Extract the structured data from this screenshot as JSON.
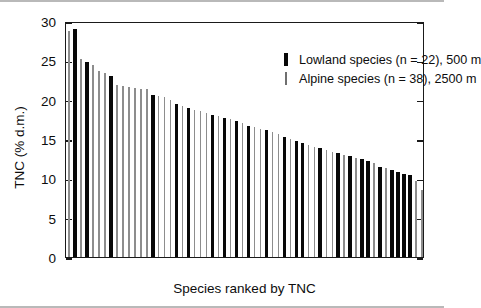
{
  "chart_data": {
    "type": "bar",
    "title": "",
    "subtitle": "",
    "xlabel": "Species ranked by TNC",
    "ylabel": "TNC (% d.m.)",
    "ylim": [
      0,
      30
    ],
    "yticks": [
      0,
      5,
      10,
      15,
      20,
      25,
      30
    ],
    "ytick_labels": [
      "0",
      "5",
      "10",
      "15",
      "20",
      "25",
      "30"
    ],
    "grid": false,
    "legend_position": "top-right",
    "legend": [
      {
        "key": "thick-black-bar",
        "label": "Lowland species (n = 22), 500 m"
      },
      {
        "key": "thin-gray-bar",
        "label": "Alpine species (n = 38), 2500 m"
      }
    ],
    "series": [
      {
        "name": "Lowland species (n = 22), 500 m",
        "count": 22,
        "color": "#080808",
        "bar_style": "thick"
      },
      {
        "name": "Alpine species (n = 38), 2500 m",
        "count": 38,
        "color": "#8d8d8d",
        "bar_style": "thin"
      }
    ],
    "categories": [
      "1",
      "2",
      "3",
      "4",
      "5",
      "6",
      "7",
      "8",
      "9",
      "10",
      "11",
      "12",
      "13",
      "14",
      "15",
      "16",
      "17",
      "18",
      "19",
      "20",
      "21",
      "22",
      "23",
      "24",
      "25",
      "26",
      "27",
      "28",
      "29",
      "30",
      "31",
      "32",
      "33",
      "34",
      "35",
      "36",
      "37",
      "38",
      "39",
      "40",
      "41",
      "42",
      "43",
      "44",
      "45",
      "46",
      "47",
      "48",
      "49",
      "50",
      "51",
      "52",
      "53",
      "54",
      "55",
      "56",
      "57",
      "58",
      "59",
      "60"
    ],
    "bars": [
      {
        "rank": 1,
        "value": 28.7,
        "group": "alpine"
      },
      {
        "rank": 2,
        "value": 29.0,
        "group": "lowland"
      },
      {
        "rank": 3,
        "value": 25.2,
        "group": "alpine"
      },
      {
        "rank": 4,
        "value": 24.8,
        "group": "lowland"
      },
      {
        "rank": 5,
        "value": 24.4,
        "group": "alpine"
      },
      {
        "rank": 6,
        "value": 23.6,
        "group": "alpine"
      },
      {
        "rank": 7,
        "value": 23.4,
        "group": "alpine"
      },
      {
        "rank": 8,
        "value": 23.0,
        "group": "lowland"
      },
      {
        "rank": 9,
        "value": 21.9,
        "group": "alpine"
      },
      {
        "rank": 10,
        "value": 21.7,
        "group": "alpine"
      },
      {
        "rank": 11,
        "value": 21.6,
        "group": "alpine"
      },
      {
        "rank": 12,
        "value": 21.5,
        "group": "alpine"
      },
      {
        "rank": 13,
        "value": 21.4,
        "group": "alpine"
      },
      {
        "rank": 14,
        "value": 21.3,
        "group": "alpine"
      },
      {
        "rank": 15,
        "value": 20.6,
        "group": "lowland"
      },
      {
        "rank": 16,
        "value": 20.5,
        "group": "alpine"
      },
      {
        "rank": 17,
        "value": 20.4,
        "group": "alpine"
      },
      {
        "rank": 18,
        "value": 20.0,
        "group": "alpine"
      },
      {
        "rank": 19,
        "value": 19.4,
        "group": "lowland"
      },
      {
        "rank": 20,
        "value": 19.2,
        "group": "alpine"
      },
      {
        "rank": 21,
        "value": 19.0,
        "group": "lowland"
      },
      {
        "rank": 22,
        "value": 18.7,
        "group": "alpine"
      },
      {
        "rank": 23,
        "value": 18.5,
        "group": "alpine"
      },
      {
        "rank": 24,
        "value": 18.3,
        "group": "alpine"
      },
      {
        "rank": 25,
        "value": 18.1,
        "group": "lowland"
      },
      {
        "rank": 26,
        "value": 17.9,
        "group": "alpine"
      },
      {
        "rank": 27,
        "value": 17.7,
        "group": "lowland"
      },
      {
        "rank": 28,
        "value": 17.5,
        "group": "alpine"
      },
      {
        "rank": 29,
        "value": 17.3,
        "group": "lowland"
      },
      {
        "rank": 30,
        "value": 17.0,
        "group": "alpine"
      },
      {
        "rank": 31,
        "value": 16.7,
        "group": "lowland"
      },
      {
        "rank": 32,
        "value": 16.5,
        "group": "alpine"
      },
      {
        "rank": 33,
        "value": 16.3,
        "group": "alpine"
      },
      {
        "rank": 34,
        "value": 16.1,
        "group": "lowland"
      },
      {
        "rank": 35,
        "value": 15.9,
        "group": "alpine"
      },
      {
        "rank": 36,
        "value": 15.6,
        "group": "alpine"
      },
      {
        "rank": 37,
        "value": 15.3,
        "group": "lowland"
      },
      {
        "rank": 38,
        "value": 15.0,
        "group": "alpine"
      },
      {
        "rank": 39,
        "value": 14.7,
        "group": "lowland"
      },
      {
        "rank": 40,
        "value": 14.5,
        "group": "lowland"
      },
      {
        "rank": 41,
        "value": 14.2,
        "group": "alpine"
      },
      {
        "rank": 42,
        "value": 14.0,
        "group": "alpine"
      },
      {
        "rank": 43,
        "value": 13.8,
        "group": "lowland"
      },
      {
        "rank": 44,
        "value": 13.6,
        "group": "alpine"
      },
      {
        "rank": 45,
        "value": 13.4,
        "group": "alpine"
      },
      {
        "rank": 46,
        "value": 13.2,
        "group": "lowland"
      },
      {
        "rank": 47,
        "value": 13.0,
        "group": "alpine"
      },
      {
        "rank": 48,
        "value": 12.8,
        "group": "lowland"
      },
      {
        "rank": 49,
        "value": 12.6,
        "group": "alpine"
      },
      {
        "rank": 50,
        "value": 12.4,
        "group": "lowland"
      },
      {
        "rank": 51,
        "value": 12.2,
        "group": "lowland"
      },
      {
        "rank": 52,
        "value": 12.0,
        "group": "alpine"
      },
      {
        "rank": 53,
        "value": 11.5,
        "group": "lowland"
      },
      {
        "rank": 54,
        "value": 11.3,
        "group": "alpine"
      },
      {
        "rank": 55,
        "value": 11.0,
        "group": "lowland"
      },
      {
        "rank": 56,
        "value": 10.8,
        "group": "lowland"
      },
      {
        "rank": 57,
        "value": 10.6,
        "group": "lowland"
      },
      {
        "rank": 58,
        "value": 10.4,
        "group": "lowland"
      },
      {
        "rank": 59,
        "value": 9.6,
        "group": "alpine"
      },
      {
        "rank": 60,
        "value": 8.5,
        "group": "alpine"
      }
    ]
  },
  "axes": {
    "y_title": "TNC (% d.m.)",
    "x_title": "Species ranked by TNC",
    "y_labels": [
      "30",
      "25",
      "20",
      "15",
      "10",
      "5",
      "0"
    ]
  },
  "legend": {
    "lowland_label": "Lowland species (n = 22), 500 m",
    "alpine_label": "Alpine species (n = 38), 2500 m"
  }
}
